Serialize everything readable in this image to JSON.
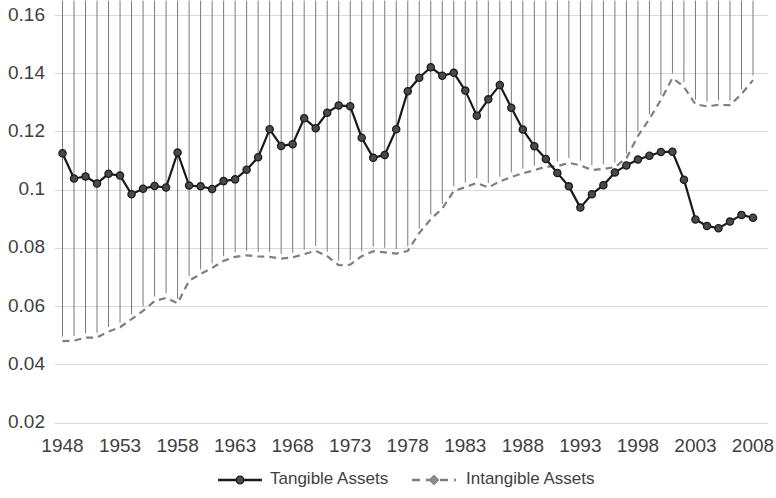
{
  "chart_data": {
    "type": "line",
    "title": "",
    "subtitle": "",
    "xlabel": "",
    "ylabel": "",
    "xlim": [
      1947,
      2008
    ],
    "ylim": [
      0.02,
      0.16
    ],
    "grid": true,
    "legend_position": "bottom",
    "x_ticks": [
      "1948",
      "1953",
      "1958",
      "1963",
      "1968",
      "1973",
      "1978",
      "1983",
      "1988",
      "1993",
      "1998",
      "2003",
      "2008"
    ],
    "y_ticks": [
      "0.02",
      "0.04",
      "0.06",
      "0.08",
      "0.1",
      "0.12",
      "0.14",
      "0.16"
    ],
    "x": [
      1948,
      1949,
      1950,
      1951,
      1952,
      1953,
      1954,
      1955,
      1956,
      1957,
      1958,
      1959,
      1960,
      1961,
      1962,
      1963,
      1964,
      1965,
      1966,
      1967,
      1968,
      1969,
      1970,
      1971,
      1972,
      1973,
      1974,
      1975,
      1976,
      1977,
      1978,
      1979,
      1980,
      1981,
      1982,
      1983,
      1984,
      1985,
      1986,
      1987,
      1988,
      1989,
      1990,
      1991,
      1992,
      1993,
      1994,
      1995,
      1996,
      1997,
      1998,
      1999,
      2000,
      2001,
      2002,
      2003,
      2004,
      2005,
      2006,
      2007,
      2008
    ],
    "series": [
      {
        "name": "Tangible Assets",
        "color": "#1a1a1a",
        "marker": "circle",
        "dash": false,
        "values": [
          0.1127,
          0.104,
          0.1047,
          0.1023,
          0.1056,
          0.105,
          0.0986,
          0.1005,
          0.1014,
          0.1009,
          0.1129,
          0.1016,
          0.1013,
          0.1004,
          0.1031,
          0.1037,
          0.107,
          0.1113,
          0.1209,
          0.1152,
          0.1158,
          0.1247,
          0.1213,
          0.1266,
          0.1291,
          0.1288,
          0.118,
          0.1111,
          0.1121,
          0.1209,
          0.134,
          0.1386,
          0.1422,
          0.1393,
          0.1403,
          0.1342,
          0.1256,
          0.1312,
          0.1361,
          0.1283,
          0.1208,
          0.1151,
          0.1107,
          0.1059,
          0.1013,
          0.094,
          0.0986,
          0.1017,
          0.1061,
          0.1085,
          0.1105,
          0.1118,
          0.1131,
          0.1132,
          0.1036,
          0.0899,
          0.0877,
          0.0869,
          0.0892,
          0.0915,
          0.0905
        ]
      },
      {
        "name": "Intangible Assets",
        "color": "#8c8c8c",
        "marker": "diamond",
        "dash": true,
        "values": [
          0.0481,
          0.0483,
          0.0493,
          0.0494,
          0.0514,
          0.0529,
          0.0557,
          0.0585,
          0.0619,
          0.063,
          0.0611,
          0.0689,
          0.0712,
          0.0733,
          0.0757,
          0.0771,
          0.0776,
          0.0772,
          0.0771,
          0.0765,
          0.0769,
          0.078,
          0.0792,
          0.0773,
          0.0742,
          0.0744,
          0.0773,
          0.079,
          0.0786,
          0.0782,
          0.0791,
          0.0853,
          0.09,
          0.0937,
          0.0997,
          0.101,
          0.1025,
          0.1009,
          0.103,
          0.1045,
          0.1058,
          0.1068,
          0.1081,
          0.1082,
          0.1094,
          0.1085,
          0.1069,
          0.1073,
          0.1079,
          0.111,
          0.1186,
          0.1245,
          0.131,
          0.1385,
          0.1355,
          0.1295,
          0.1288,
          0.1293,
          0.1292,
          0.133,
          0.1378
        ]
      }
    ]
  },
  "legend": {
    "items": [
      {
        "label": "Tangible Assets"
      },
      {
        "label": "Intangible Assets"
      }
    ]
  }
}
